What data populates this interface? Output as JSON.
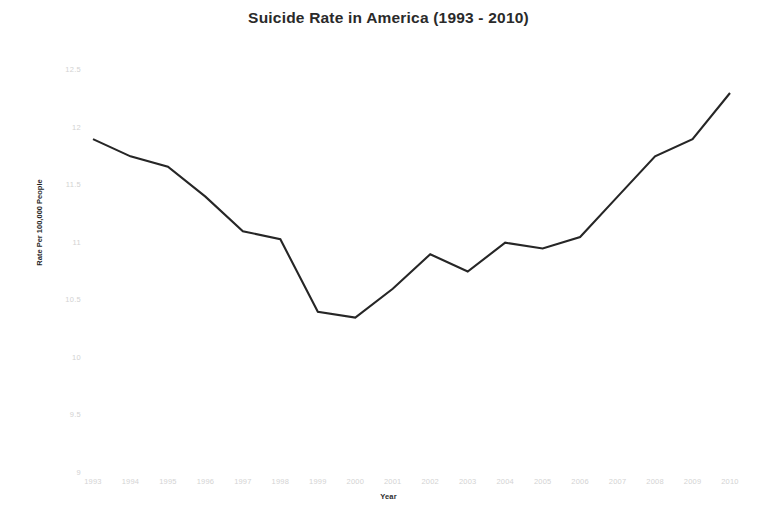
{
  "chart_data": {
    "type": "line",
    "title": "Suicide Rate in America (1993 - 2010)",
    "xlabel": "Year",
    "ylabel": "Rate Per 100,000 People",
    "categories": [
      "1993",
      "1994",
      "1995",
      "1996",
      "1997",
      "1998",
      "1999",
      "2000",
      "2001",
      "2002",
      "2003",
      "2004",
      "2005",
      "2006",
      "2007",
      "2008",
      "2009",
      "2010"
    ],
    "values": [
      11.9,
      11.75,
      11.66,
      11.4,
      11.1,
      11.03,
      10.4,
      10.35,
      10.6,
      10.9,
      10.75,
      11.0,
      10.95,
      11.05,
      11.4,
      11.75,
      11.9,
      12.3
    ],
    "series": [
      {
        "name": "Suicide Rate",
        "values": [
          11.9,
          11.75,
          11.66,
          11.4,
          11.1,
          11.03,
          10.4,
          10.35,
          10.6,
          10.9,
          10.75,
          11.0,
          10.95,
          11.05,
          11.4,
          11.75,
          11.9,
          12.3
        ]
      }
    ],
    "ylim": [
      9,
      12.5
    ],
    "yticks": [
      "12.5",
      "12",
      "11.5",
      "11",
      "10.5",
      "10",
      "9.5",
      "9"
    ],
    "ytick_values": [
      12.5,
      12,
      11.5,
      11,
      10.5,
      10,
      9.5,
      9
    ],
    "xticks": [
      "1993",
      "1994",
      "1995",
      "1996",
      "1997",
      "1998",
      "1999",
      "2000",
      "2001",
      "2002",
      "2003",
      "2004",
      "2005",
      "2006",
      "2007",
      "2008",
      "2009",
      "2010"
    ],
    "grid": false,
    "legend": "none",
    "line_color": "#262626",
    "background_color": "#ffffff",
    "tick_color": "#d3d3d3"
  }
}
